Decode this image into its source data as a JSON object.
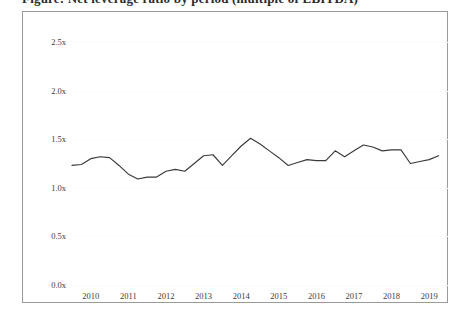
{
  "title": "Figure: Net leverage ratio by period (multiple of EBITDA)",
  "chart_data": {
    "type": "line",
    "title": "Figure: Net leverage ratio by period (multiple of EBITDA)",
    "xlabel": "",
    "ylabel": "",
    "ylim": [
      0.0,
      2.5
    ],
    "ytick_labels": [
      "0.0x",
      "0.5x",
      "1.0x",
      "1.5x",
      "2.0x",
      "2.5x"
    ],
    "ytick_values": [
      0.0,
      0.5,
      1.0,
      1.5,
      2.0,
      2.5
    ],
    "xtick_labels": [
      "2010",
      "2011",
      "2012",
      "2013",
      "2014",
      "2015",
      "2016",
      "2017",
      "2018",
      "2019"
    ],
    "xtick_values": [
      2010,
      2011,
      2012,
      2013,
      2014,
      2015,
      2016,
      2017,
      2018,
      2019
    ],
    "xlim": [
      2010,
      2020
    ],
    "grid": true,
    "legend": "none",
    "series": [
      {
        "name": "Net leverage",
        "color": "#3a3a3a",
        "x": [
          2010.0,
          2010.25,
          2010.5,
          2010.75,
          2011.0,
          2011.25,
          2011.5,
          2011.75,
          2012.0,
          2012.25,
          2012.5,
          2012.75,
          2013.0,
          2013.25,
          2013.5,
          2013.75,
          2014.0,
          2014.25,
          2014.5,
          2014.75,
          2015.0,
          2015.25,
          2015.5,
          2015.75,
          2016.0,
          2016.25,
          2016.5,
          2016.75,
          2017.0,
          2017.25,
          2017.5,
          2017.75,
          2018.0,
          2018.25,
          2018.5,
          2018.75,
          2019.0,
          2019.25,
          2019.5,
          2019.75
        ],
        "values": [
          1.23,
          1.24,
          1.3,
          1.32,
          1.31,
          1.23,
          1.14,
          1.09,
          1.11,
          1.11,
          1.17,
          1.19,
          1.17,
          1.25,
          1.33,
          1.34,
          1.23,
          1.33,
          1.43,
          1.51,
          1.45,
          1.38,
          1.31,
          1.23,
          1.26,
          1.29,
          1.28,
          1.28,
          1.38,
          1.32,
          1.38,
          1.44,
          1.42,
          1.38,
          1.39,
          1.39,
          1.25,
          1.27,
          1.29,
          1.33
        ]
      }
    ],
    "min_value": 1.09,
    "max_value": 1.51
  }
}
